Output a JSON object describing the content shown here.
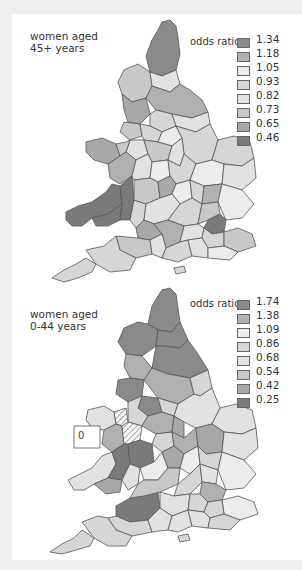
{
  "figure": {
    "maps": [
      {
        "id": "top",
        "caption_line1": "women aged",
        "caption_line2": "45+ years",
        "legend_title": "odds ratio",
        "legend": [
          {
            "value": "1.34",
            "color": "#8a8a8a"
          },
          {
            "value": "1.18",
            "color": "#b0b0b0"
          },
          {
            "value": "1.05",
            "color": "#ececec"
          },
          {
            "value": "0.93",
            "color": "#d6d6d6"
          },
          {
            "value": "0.82",
            "color": "#e2e2e2"
          },
          {
            "value": "0.73",
            "color": "#c8c8c8"
          },
          {
            "value": "0.65",
            "color": "#a8a8a8"
          },
          {
            "value": "0.46",
            "color": "#7a7a7a"
          }
        ]
      },
      {
        "id": "bottom",
        "caption_line1": "women aged",
        "caption_line2": "0-44 years",
        "legend_title": "odds ratio",
        "legend": [
          {
            "value": "1.74",
            "color": "#8a8a8a"
          },
          {
            "value": "1.38",
            "color": "#b0b0b0"
          },
          {
            "value": "1.09",
            "color": "#ececec"
          },
          {
            "value": "0.86",
            "color": "#d6d6d6"
          },
          {
            "value": "0.68",
            "color": "#e2e2e2"
          },
          {
            "value": "0.54",
            "color": "#c8c8c8"
          },
          {
            "value": "0.42",
            "color": "#a8a8a8"
          },
          {
            "value": "0.25",
            "color": "#7a7a7a"
          }
        ],
        "inset_label": "0"
      }
    ]
  },
  "colors": {
    "background": "#eeeeee",
    "panel": "#ffffff",
    "border": "#555555",
    "hatch": "#ffffff"
  }
}
